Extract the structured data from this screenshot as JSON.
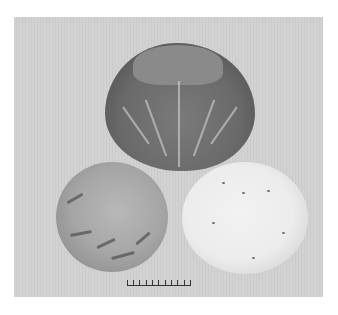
{
  "image": {
    "description": "Photograph of three cabbages on a light grey background: one whole cabbage on top, a whole cabbage at bottom-left, and a cross-section cut cabbage at bottom-right, with a scale bar below",
    "background_color": "#cfcfcf",
    "border_color": "#ffffff",
    "objects": [
      {
        "name": "whole-cabbage-top",
        "tone": "#6e6e6e"
      },
      {
        "name": "whole-cabbage-bottom-left",
        "tone": "#a8a8a8"
      },
      {
        "name": "cut-cabbage-cross-section",
        "tone": "#ececec"
      }
    ],
    "scale_bar": {
      "ticks": 11,
      "intervals": 10
    }
  }
}
